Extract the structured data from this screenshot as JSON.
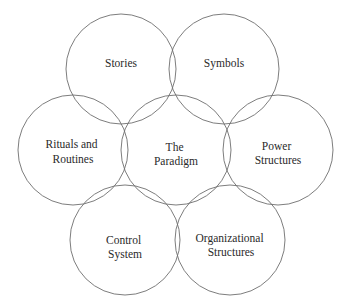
{
  "diagram": {
    "type": "cultural-web",
    "stroke_color": "#6e6e6e",
    "text_color": "#2a2a2a",
    "nodes": [
      {
        "id": "stories",
        "lines": [
          "Stories"
        ],
        "cx": 121,
        "cy": 69,
        "r": 55
      },
      {
        "id": "symbols",
        "lines": [
          "Symbols"
        ],
        "cx": 224,
        "cy": 69,
        "r": 55
      },
      {
        "id": "rituals-and-routines",
        "lines": [
          "Rituals and",
          "Routines"
        ],
        "cx": 73,
        "cy": 150,
        "r": 55
      },
      {
        "id": "the-paradigm",
        "lines": [
          "The",
          "Paradigm"
        ],
        "cx": 176,
        "cy": 150,
        "r": 55
      },
      {
        "id": "power-structures",
        "lines": [
          "Power",
          "Structures"
        ],
        "cx": 278,
        "cy": 150,
        "r": 55
      },
      {
        "id": "control-system",
        "lines": [
          "Control",
          "System"
        ],
        "cx": 125,
        "cy": 240,
        "r": 55
      },
      {
        "id": "organizational-structures",
        "lines": [
          "Organizational",
          "Structures"
        ],
        "cx": 230,
        "cy": 240,
        "r": 55
      }
    ]
  }
}
